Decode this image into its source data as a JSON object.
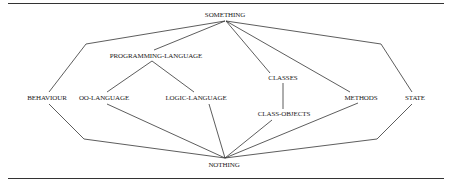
{
  "diagram": {
    "type": "lattice",
    "nodes": {
      "something": {
        "label": "SOMETHING",
        "x": 225,
        "y": 15
      },
      "programming_language": {
        "label": "PROGRAMMING-LANGUAGE",
        "x": 156,
        "y": 56
      },
      "behaviour": {
        "label": "BEHAVIOUR",
        "x": 47,
        "y": 98
      },
      "oo_language": {
        "label": "OO-LANGUAGE",
        "x": 104,
        "y": 98
      },
      "logic_language": {
        "label": "LOGIC-LANGUAGE",
        "x": 196,
        "y": 98
      },
      "classes": {
        "label": "CLASSES",
        "x": 283,
        "y": 78
      },
      "class_objects": {
        "label": "CLASS-OBJECTS",
        "x": 284,
        "y": 114
      },
      "methods": {
        "label": "METHODS",
        "x": 361,
        "y": 98
      },
      "state": {
        "label": "STATE",
        "x": 415,
        "y": 98
      },
      "nothing": {
        "label": "NOTHING",
        "x": 224,
        "y": 165
      }
    },
    "edges": [
      [
        "something",
        "programming_language"
      ],
      [
        "something",
        "behaviour"
      ],
      [
        "something",
        "classes"
      ],
      [
        "something",
        "methods"
      ],
      [
        "something",
        "state"
      ],
      [
        "programming_language",
        "oo_language"
      ],
      [
        "programming_language",
        "logic_language"
      ],
      [
        "classes",
        "class_objects"
      ],
      [
        "behaviour",
        "nothing"
      ],
      [
        "oo_language",
        "nothing"
      ],
      [
        "logic_language",
        "nothing"
      ],
      [
        "class_objects",
        "nothing"
      ],
      [
        "methods",
        "nothing"
      ],
      [
        "state",
        "nothing"
      ]
    ],
    "line_color": "#333333",
    "rule_color": "#333333"
  }
}
